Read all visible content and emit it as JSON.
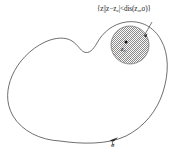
{
  "figure": {
    "type": "math-diagram",
    "background_color": "#ffffff",
    "stroke_color": "#555555",
    "labels": {
      "set_notation": "{z||z−z₀|<dis(z₀,σ)}",
      "center_point": "z₀",
      "curve_name": "σ"
    },
    "elements": {
      "closed_curve_name": "sigma-curve",
      "disk_name": "hatched-open-disk",
      "center_dot_name": "center-point-dot",
      "leader_line_name": "set-label-leader-line",
      "arrow_name": "curve-label-arrow"
    },
    "geometry": {
      "disk_center_x": 130,
      "disk_center_y": 45,
      "disk_radius": 19,
      "center_dot_x": 126,
      "center_dot_y": 42
    }
  }
}
